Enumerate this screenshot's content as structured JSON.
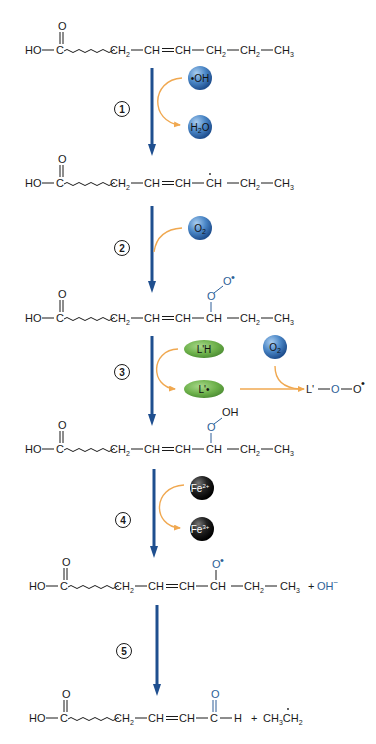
{
  "diagram": {
    "type": "reaction-pathway",
    "molecules": [
      {
        "id": "m1",
        "label": "HO—C(=O)~~~~CH2—CH=CH—CH2—CH2—CH3",
        "description": "Polyunsaturated fatty acid"
      },
      {
        "id": "m2",
        "label": "HO—C(=O)~~~~CH2—CH=CH—ĊH—CH2—CH3",
        "description": "Lipid radical"
      },
      {
        "id": "m3",
        "label": "HO—C(=O)~~~~CH2—CH=CH—CH(O—O•)—CH2—CH3",
        "description": "Lipid peroxyl radical"
      },
      {
        "id": "m4",
        "label": "HO—C(=O)~~~~CH2—CH=CH—CH(O—OH)—CH2—CH3",
        "description": "Lipid hydroperoxide"
      },
      {
        "id": "m5",
        "label": "HO—C(=O)~~~~CH2—CH=CH—CH(O•)—CH2—CH3 + OH−",
        "description": "Lipid alkoxyl radical"
      },
      {
        "id": "m6",
        "label": "HO—C(=O)~~~~CH2—CH=CH—C(=O)—H + CH3ĊH2",
        "description": "Aldehyde + ethyl radical"
      }
    ],
    "steps": [
      {
        "number": "1",
        "reactant": "•OH",
        "product": "H2O"
      },
      {
        "number": "2",
        "reactant": "O2",
        "product": ""
      },
      {
        "number": "3",
        "reactant": "L'H",
        "product": "L'•",
        "side_reactant": "O2",
        "side_product": "L'—O—O•"
      },
      {
        "number": "4",
        "reactant": "Fe2+",
        "product": "Fe3+"
      },
      {
        "number": "5",
        "reactant": "",
        "product": ""
      }
    ],
    "text": {
      "HO": "HO",
      "C": "C",
      "O": "O",
      "CH": "CH",
      "CH2": "CH",
      "CH3": "CH",
      "H": "H",
      "sub2": "2",
      "sub3": "3",
      "plus": "+",
      "OHminus": "OH",
      "minus": "−",
      "Orad": "O",
      "radical_dot": "•",
      "OH": "OH",
      "Lprime": "L'",
      "ethyl_a": "CH",
      "ethyl_b": "CH"
    },
    "balls": {
      "oh_radical": "•OH",
      "water_a": "H",
      "water_sub": "2",
      "water_b": "O",
      "o2": "O",
      "o2_sub": "2",
      "lh": "L'H",
      "lrad": "L'•",
      "fe2": "Fe",
      "fe2_sup": "2+",
      "fe3": "Fe",
      "fe3_sup": "3+"
    },
    "colors": {
      "arrow": "#1f4f8f",
      "orange_arrow": "#f0a850",
      "blue_ball": "#3f78b8",
      "green_ball": "#6cb04a",
      "black_ball": "#1a1a1a",
      "blue_text": "#2e5f98"
    }
  }
}
